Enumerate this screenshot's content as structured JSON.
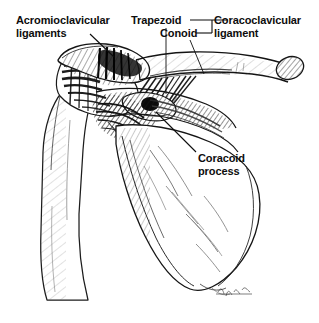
{
  "figure": {
    "kind": "anatomical-line-drawing",
    "background_color": "#ffffff",
    "ink_color": "#0d0d0d",
    "width": 319,
    "height": 323
  },
  "labels": {
    "acromioclavicular": {
      "line1": "Acromioclavicular",
      "line2": "ligaments"
    },
    "trapezoid": {
      "text": "Trapezoid"
    },
    "conoid": {
      "text": "Conoid"
    },
    "coracoclavicular": {
      "line1": "Coracoclavicular",
      "line2": "ligament"
    },
    "coracoid": {
      "line1": "Coracoid",
      "line2": "process"
    }
  },
  "signature": {
    "present": true,
    "text": ""
  }
}
